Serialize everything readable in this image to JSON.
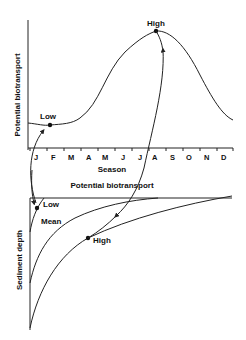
{
  "top_panel": {
    "y_axis_label": "Potential biotransport",
    "x_axis_label": "Season",
    "months": [
      "J",
      "F",
      "M",
      "A",
      "M",
      "J",
      "J",
      "A",
      "S",
      "O",
      "N",
      "D"
    ],
    "points": {
      "low": "Low",
      "high": "High"
    }
  },
  "bottom_panel": {
    "x_axis_label": "Potential biotransport",
    "y_axis_label": "Sediment depth",
    "curves": {
      "low": "Low",
      "mean": "Mean",
      "high": "High"
    }
  },
  "colors": {
    "line": "#222222",
    "background": "#ffffff"
  }
}
